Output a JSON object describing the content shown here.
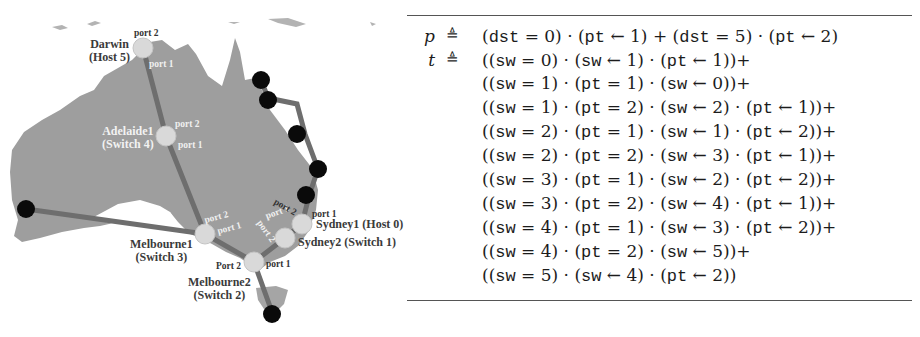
{
  "map": {
    "nodes": [
      {
        "id": "darwin",
        "name": "Darwin",
        "role": "(Host 5)",
        "ports": [
          "port 2",
          "port 1"
        ]
      },
      {
        "id": "adelaide1",
        "name": "Adelaide1",
        "role": "(Switch 4)",
        "ports": [
          "port 2",
          "port 1"
        ]
      },
      {
        "id": "melbourne1",
        "name": "Melbourne1",
        "role": "(Switch 3)",
        "ports": [
          "port 2",
          "port 1"
        ]
      },
      {
        "id": "melbourne2",
        "name": "Melbourne2",
        "role": "(Switch 2)",
        "ports": [
          "Port 2",
          "port 1"
        ]
      },
      {
        "id": "sydney2",
        "name": "Sydney2 (Switch 1)",
        "ports": [
          "port 2",
          "port 1"
        ]
      },
      {
        "id": "sydney1",
        "name": "Sydney1 (Host 0)",
        "ports": [
          "port 2",
          "port 1"
        ]
      }
    ],
    "colors": {
      "land": "#9e9e9e",
      "link": "#6e6e6e",
      "node": "#d9d9d9",
      "endpoint": "#0a0a0a"
    }
  },
  "formula": {
    "rows": [
      {
        "lhs": "p",
        "op": "≜",
        "parts": [
          [
            "(",
            "dst",
            " = 0) · (",
            "pt",
            " ← 1) + (",
            "dst",
            " = 5) · (",
            "pt",
            " ← 2)"
          ]
        ]
      },
      {
        "lhs": "t",
        "op": "≜",
        "parts": [
          [
            "((",
            "sw",
            " = 0) · (",
            "sw",
            " ← 1) · (",
            "pt",
            " ← 1))+"
          ]
        ]
      },
      {
        "lhs": "",
        "op": "",
        "parts": [
          [
            "((",
            "sw",
            " = 1) · (",
            "pt",
            " = 1) · (",
            "sw",
            " ← 0))+"
          ]
        ]
      },
      {
        "lhs": "",
        "op": "",
        "parts": [
          [
            "((",
            "sw",
            " = 1) · (",
            "pt",
            " = 2) · (",
            "sw",
            " ← 2) · (",
            "pt",
            " ← 1))+"
          ]
        ]
      },
      {
        "lhs": "",
        "op": "",
        "parts": [
          [
            "((",
            "sw",
            " = 2) · (",
            "pt",
            " = 1) · (",
            "sw",
            " ← 1) · (",
            "pt",
            " ← 2))+"
          ]
        ]
      },
      {
        "lhs": "",
        "op": "",
        "parts": [
          [
            "((",
            "sw",
            " = 2) · (",
            "pt",
            " = 2) · (",
            "sw",
            " ← 3) · (",
            "pt",
            " ← 1))+"
          ]
        ]
      },
      {
        "lhs": "",
        "op": "",
        "parts": [
          [
            "((",
            "sw",
            " = 3) · (",
            "pt",
            " = 1) · (",
            "sw",
            " ← 2) · (",
            "pt",
            " ← 2))+"
          ]
        ]
      },
      {
        "lhs": "",
        "op": "",
        "parts": [
          [
            "((",
            "sw",
            " = 3) · (",
            "pt",
            " = 2) · (",
            "sw",
            " ← 4) · (",
            "pt",
            " ← 1))+"
          ]
        ]
      },
      {
        "lhs": "",
        "op": "",
        "parts": [
          [
            "((",
            "sw",
            " = 4) · (",
            "pt",
            " = 1) · (",
            "sw",
            " ← 3) · (",
            "pt",
            " ← 2))+"
          ]
        ]
      },
      {
        "lhs": "",
        "op": "",
        "parts": [
          [
            "((",
            "sw",
            " = 4) · (",
            "pt",
            " = 2) · (",
            "sw",
            " ← 5))+"
          ]
        ]
      },
      {
        "lhs": "",
        "op": "",
        "parts": [
          [
            "((",
            "sw",
            " = 5) · (",
            "sw",
            " ← 4) · (",
            "pt",
            " ← 2))"
          ]
        ]
      }
    ],
    "cut_text": "program   t   topology   in NetKAT"
  }
}
